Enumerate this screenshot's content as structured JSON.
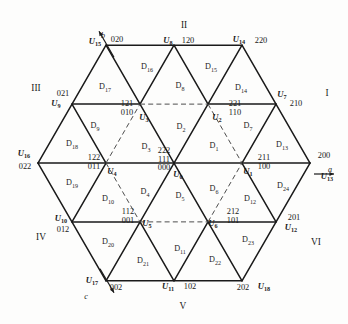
{
  "figure": {
    "type": "space-vector-hexagon",
    "axes": [
      {
        "name": "a-axis",
        "label": "a",
        "x": 330,
        "y": 170,
        "angle_deg": 0
      },
      {
        "name": "b-axis",
        "label": "b",
        "x": 103,
        "y": 36,
        "angle_deg": 60
      },
      {
        "name": "c-axis",
        "label": "c",
        "x": 86,
        "y": 297,
        "angle_deg": 240
      }
    ],
    "sectors": [
      {
        "name": "sector-I",
        "label": "I",
        "x": 327,
        "y": 94
      },
      {
        "name": "sector-II",
        "label": "II",
        "x": 184,
        "y": 26
      },
      {
        "name": "sector-III",
        "label": "III",
        "x": 36,
        "y": 89
      },
      {
        "name": "sector-IV",
        "label": "IV",
        "x": 41,
        "y": 238
      },
      {
        "name": "sector-V",
        "label": "V",
        "x": 183,
        "y": 307
      },
      {
        "name": "sector-VI",
        "label": "VI",
        "x": 316,
        "y": 243
      }
    ],
    "vectors": [
      {
        "name": "U0",
        "sym": "U",
        "idx": "0",
        "x": 178,
        "y": 175,
        "states": [
          "222",
          "111",
          "000"
        ],
        "state_x": 164,
        "state_y": 160,
        "stacked": true
      },
      {
        "name": "U1",
        "sym": "U",
        "idx": "1",
        "x": 248,
        "y": 172,
        "states": [
          "211",
          "100"
        ],
        "state_x": 264,
        "state_y": 163,
        "stacked": true
      },
      {
        "name": "U2",
        "sym": "U",
        "idx": "2",
        "x": 217,
        "y": 118,
        "states": [
          "221",
          "110"
        ],
        "state_x": 235,
        "state_y": 109,
        "stacked": true
      },
      {
        "name": "U3",
        "sym": "U",
        "idx": "3",
        "x": 144,
        "y": 118,
        "states": [
          "121",
          "010"
        ],
        "state_x": 127,
        "state_y": 109,
        "stacked": true
      },
      {
        "name": "U4",
        "sym": "U",
        "idx": "4",
        "x": 112,
        "y": 172,
        "states": [
          "122",
          "011"
        ],
        "state_x": 94,
        "state_y": 163,
        "stacked": true
      },
      {
        "name": "U5",
        "sym": "U",
        "idx": "5",
        "x": 147,
        "y": 224,
        "states": [
          "112",
          "001"
        ],
        "state_x": 128,
        "state_y": 217,
        "stacked": true
      },
      {
        "name": "U6",
        "sym": "U",
        "idx": "6",
        "x": 213,
        "y": 224,
        "states": [
          "212",
          "101"
        ],
        "state_x": 233,
        "state_y": 217,
        "stacked": true
      },
      {
        "name": "U7",
        "sym": "U",
        "idx": "7",
        "x": 282,
        "y": 95,
        "states": [
          "210"
        ],
        "state_x": 296,
        "state_y": 104,
        "stacked": false
      },
      {
        "name": "U8",
        "sym": "U",
        "idx": "8",
        "x": 168,
        "y": 41,
        "states": [
          "120"
        ],
        "state_x": 188,
        "state_y": 41,
        "stacked": false
      },
      {
        "name": "U9",
        "sym": "U",
        "idx": "9",
        "x": 56,
        "y": 104,
        "states": [
          "021"
        ],
        "state_x": 63,
        "state_y": 94,
        "stacked": false
      },
      {
        "name": "U10",
        "sym": "U",
        "idx": "10",
        "x": 61,
        "y": 219,
        "states": [
          "012"
        ],
        "state_x": 63,
        "state_y": 230,
        "stacked": false
      },
      {
        "name": "U11",
        "sym": "U",
        "idx": "11",
        "x": 168,
        "y": 287,
        "states": [
          "102"
        ],
        "state_x": 190,
        "state_y": 287,
        "stacked": false
      },
      {
        "name": "U12",
        "sym": "U",
        "idx": "12",
        "x": 291,
        "y": 228,
        "states": [
          "201"
        ],
        "state_x": 294,
        "state_y": 218,
        "stacked": false
      },
      {
        "name": "U13",
        "sym": "U",
        "idx": "13",
        "x": 327,
        "y": 177,
        "states": [
          "200"
        ],
        "state_x": 324,
        "state_y": 156,
        "stacked": false
      },
      {
        "name": "U14",
        "sym": "U",
        "idx": "14",
        "x": 239,
        "y": 40,
        "states": [
          "220"
        ],
        "state_x": 261,
        "state_y": 41,
        "stacked": false
      },
      {
        "name": "U15",
        "sym": "U",
        "idx": "15",
        "x": 95,
        "y": 42,
        "states": [
          "020"
        ],
        "state_x": 117,
        "state_y": 40,
        "stacked": false
      },
      {
        "name": "U16",
        "sym": "U",
        "idx": "16",
        "x": 24,
        "y": 154,
        "states": [
          "022"
        ],
        "state_x": 25,
        "state_y": 167,
        "stacked": false
      },
      {
        "name": "U17",
        "sym": "U",
        "idx": "17",
        "x": 92,
        "y": 281,
        "states": [
          "002"
        ],
        "state_x": 116,
        "state_y": 288,
        "stacked": false
      },
      {
        "name": "U18",
        "sym": "U",
        "idx": "18",
        "x": 264,
        "y": 287,
        "states": [
          "202"
        ],
        "state_x": 243,
        "state_y": 288,
        "stacked": false
      }
    ],
    "regions": [
      {
        "name": "D1",
        "label": "D",
        "idx": "1",
        "x": 214,
        "y": 147
      },
      {
        "name": "D2",
        "label": "D",
        "idx": "2",
        "x": 181,
        "y": 128
      },
      {
        "name": "D3",
        "label": "D",
        "idx": "3",
        "x": 146,
        "y": 148
      },
      {
        "name": "D4",
        "label": "D",
        "idx": "4",
        "x": 145,
        "y": 193
      },
      {
        "name": "D5",
        "label": "D",
        "idx": "5",
        "x": 180,
        "y": 197
      },
      {
        "name": "D6",
        "label": "D",
        "idx": "6",
        "x": 214,
        "y": 190
      },
      {
        "name": "D7",
        "label": "D",
        "idx": "7",
        "x": 248,
        "y": 127
      },
      {
        "name": "D8",
        "label": "D",
        "idx": "8",
        "x": 180,
        "y": 87
      },
      {
        "name": "D9",
        "label": "D",
        "idx": "9",
        "x": 95,
        "y": 127
      },
      {
        "name": "D10",
        "label": "D",
        "idx": "10",
        "x": 108,
        "y": 200
      },
      {
        "name": "D11",
        "label": "D",
        "idx": "11",
        "x": 180,
        "y": 250
      },
      {
        "name": "D12",
        "label": "D",
        "idx": "12",
        "x": 250,
        "y": 200
      },
      {
        "name": "D13",
        "label": "D",
        "idx": "13",
        "x": 282,
        "y": 146
      },
      {
        "name": "D14",
        "label": "D",
        "idx": "14",
        "x": 241,
        "y": 89
      },
      {
        "name": "D15",
        "label": "D",
        "idx": "15",
        "x": 211,
        "y": 68
      },
      {
        "name": "D16",
        "label": "D",
        "idx": "16",
        "x": 147,
        "y": 68
      },
      {
        "name": "D17",
        "label": "D",
        "idx": "17",
        "x": 105,
        "y": 88
      },
      {
        "name": "D18",
        "label": "D",
        "idx": "18",
        "x": 72,
        "y": 145
      },
      {
        "name": "D19",
        "label": "D",
        "idx": "19",
        "x": 72,
        "y": 184
      },
      {
        "name": "D20",
        "label": "D",
        "idx": "20",
        "x": 108,
        "y": 243
      },
      {
        "name": "D21",
        "label": "D",
        "idx": "21",
        "x": 143,
        "y": 262
      },
      {
        "name": "D22",
        "label": "D",
        "idx": "22",
        "x": 215,
        "y": 261
      },
      {
        "name": "D23",
        "label": "D",
        "idx": "23",
        "x": 248,
        "y": 241
      },
      {
        "name": "D24",
        "label": "D",
        "idx": "24",
        "x": 283,
        "y": 187
      }
    ]
  },
  "geometry": {
    "center": {
      "x": 174,
      "y": 163
    },
    "radius": 136,
    "solid_color": "#1a1a1a",
    "dash_color": "#555555"
  }
}
